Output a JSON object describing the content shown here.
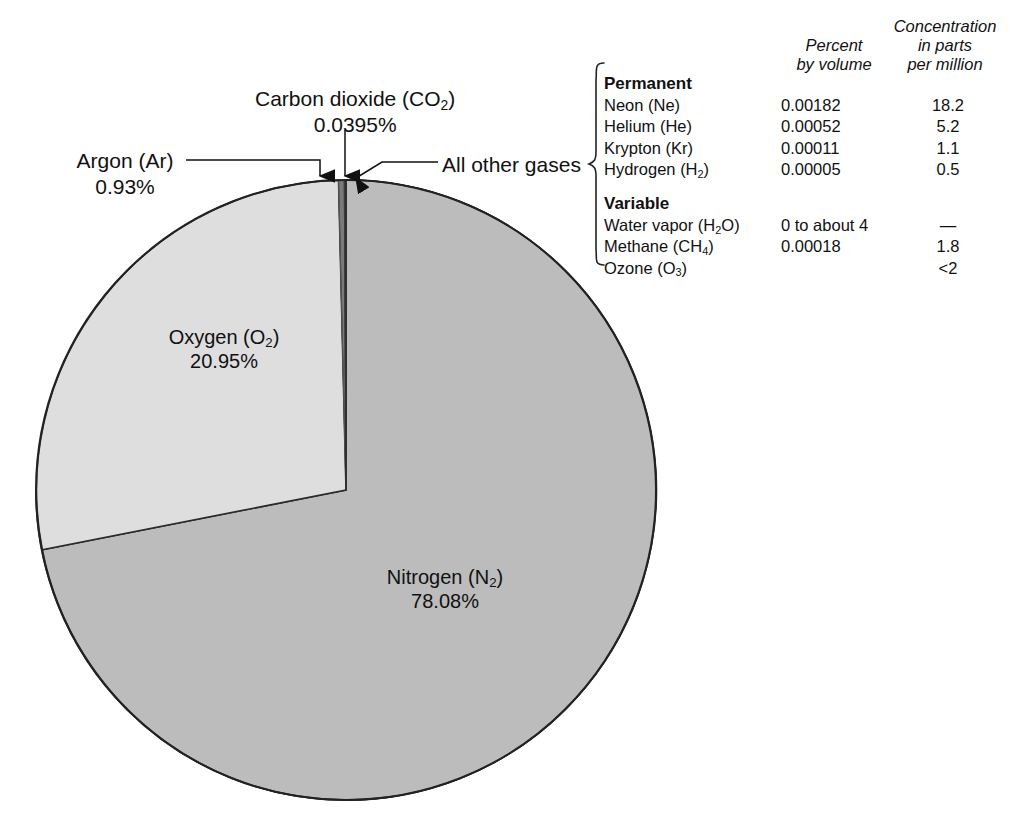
{
  "chart_data": {
    "type": "pie",
    "title": "",
    "categories": [
      "Nitrogen (N2)",
      "Oxygen (O2)",
      "Argon (Ar)",
      "Carbon dioxide (CO2)",
      "All other gases"
    ],
    "values": [
      78.08,
      20.95,
      0.93,
      0.0395,
      0.0005
    ],
    "unit": "percent by volume",
    "legend": "none",
    "slice_colors": [
      "#bcbcbc",
      "#dedede",
      "#6e6e6e",
      "#4a4a4a",
      "#8a8a8a"
    ],
    "start_angle_deg": 0,
    "direction": "clockwise",
    "labels_inline": true
  },
  "pie": {
    "nitrogen": {
      "name_main": "Nitrogen (N",
      "name_sub": "2",
      "name_tail": ")",
      "value": "78.08%"
    },
    "oxygen": {
      "name_main": "Oxygen (O",
      "name_sub": "2",
      "name_tail": ")",
      "value": "20.95%"
    },
    "argon": {
      "name_main": "Argon (Ar)",
      "value": "0.93%"
    },
    "co2": {
      "name_main": "Carbon dioxide (CO",
      "name_sub": "2",
      "name_tail": ")",
      "value": "0.0395%"
    },
    "other": {
      "name_main": "All other gases"
    }
  },
  "table": {
    "headers": {
      "col_gas": "",
      "col_percent_l1": "Percent",
      "col_percent_l2": "by volume",
      "col_conc_l1": "Concentration",
      "col_conc_l2": "in parts",
      "col_conc_l3": "per million"
    },
    "groups": [
      {
        "label": "Permanent",
        "rows": [
          {
            "gas_main": "Neon (Ne)",
            "gas_sub": "",
            "gas_tail": "",
            "percent": "0.00182",
            "ppm": "18.2"
          },
          {
            "gas_main": "Helium (He)",
            "gas_sub": "",
            "gas_tail": "",
            "percent": "0.00052",
            "ppm": "5.2"
          },
          {
            "gas_main": "Krypton (Kr)",
            "gas_sub": "",
            "gas_tail": "",
            "percent": "0.00011",
            "ppm": "1.1"
          },
          {
            "gas_main": "Hydrogen (H",
            "gas_sub": "2",
            "gas_tail": ")",
            "percent": "0.00005",
            "ppm": "0.5"
          }
        ]
      },
      {
        "label": "Variable",
        "rows": [
          {
            "gas_main": "Water vapor (H",
            "gas_sub": "2",
            "gas_tail": "O)",
            "percent": "0 to about 4",
            "ppm": "—"
          },
          {
            "gas_main": "Methane (CH",
            "gas_sub": "4",
            "gas_tail": ")",
            "percent": "0.00018",
            "ppm": "1.8"
          },
          {
            "gas_main": "Ozone (O",
            "gas_sub": "3",
            "gas_tail": ")",
            "percent": "",
            "ppm": "<2"
          }
        ]
      }
    ]
  }
}
